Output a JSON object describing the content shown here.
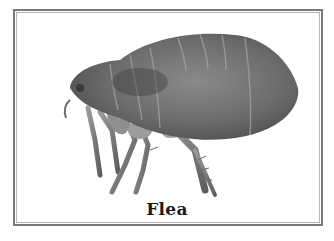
{
  "card": {
    "label": "Flea",
    "image_subject": "flea-photograph",
    "border_color": "#7a7a7a",
    "background": "#ffffff"
  }
}
